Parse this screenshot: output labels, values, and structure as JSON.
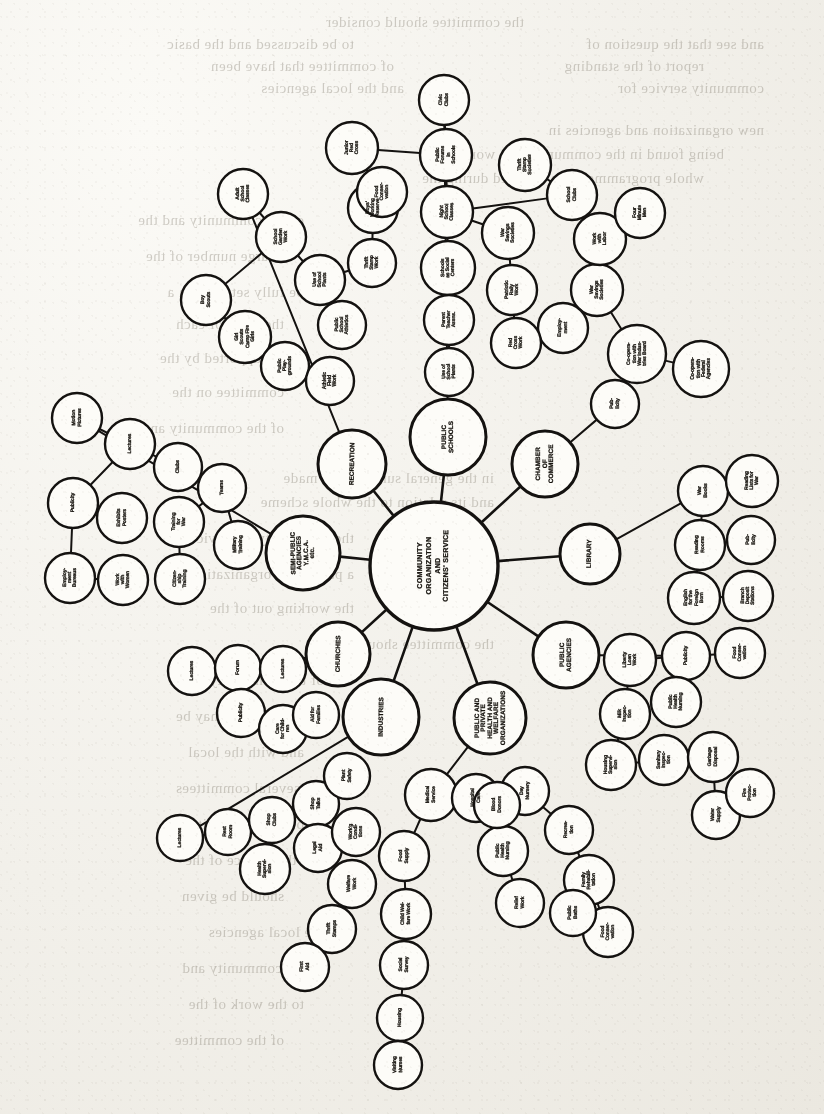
{
  "document": {
    "kind": "scanned-book-page",
    "figure_type": "radial hub-and-spoke organization chart",
    "ink_color": "#17140f",
    "paper_color": "#f2f0ea"
  },
  "chart_data": {
    "type": "diagram",
    "title": "COMMUNITY ORGANIZATION AND CITIZENS' SERVICE",
    "layout": "radial hub-and-spoke; one core node, eight primary hubs on a ring, each hub branching into chains of satellite nodes",
    "center": {
      "id": "core",
      "label": "COMMUNITY\nORGANIZATION\nAND\nCITIZENS' SERVICE",
      "cx": 434,
      "cy": 566,
      "r": 64
    },
    "hubs": [
      {
        "id": "public-schools",
        "label": "PUBLIC\nSCHOOLS",
        "cx": 448,
        "cy": 437,
        "r": 38,
        "angle": -84
      },
      {
        "id": "chamber",
        "label": "CHAMBER\nOF\nCOMMERCE",
        "cx": 545,
        "cy": 464,
        "r": 33,
        "angle": -45
      },
      {
        "id": "library",
        "label": "LIBRARY",
        "cx": 590,
        "cy": 554,
        "r": 30,
        "angle": -6
      },
      {
        "id": "public-agencies",
        "label": "PUBLIC\nAGENCIES",
        "cx": 566,
        "cy": 655,
        "r": 33,
        "angle": 36
      },
      {
        "id": "health-welfare",
        "label": "PUBLIC AND\nPRIVATE\nHEALTH AND\nWELFARE\nORGANIZATIONS",
        "cx": 490,
        "cy": 718,
        "r": 36,
        "angle": 72
      },
      {
        "id": "industries",
        "label": "INDUSTRIES",
        "cx": 381,
        "cy": 717,
        "r": 38,
        "angle": 115
      },
      {
        "id": "churches",
        "label": "CHURCHES",
        "cx": 338,
        "cy": 654,
        "r": 32,
        "angle": 155
      },
      {
        "id": "semi-public",
        "label": "SEMI-PUBLIC\nAGENCIES\nY.M.C.A.\netc.",
        "cx": 303,
        "cy": 553,
        "r": 37,
        "angle": 186
      },
      {
        "id": "recreation",
        "label": "RECREATION",
        "cx": 352,
        "cy": 464,
        "r": 34,
        "angle": 222
      }
    ],
    "satellites": [
      {
        "label": "Civic\nClubs",
        "cx": 444,
        "cy": 100,
        "r": 25,
        "parent": "public-schools"
      },
      {
        "label": "Public\nForums\nin\nSchools",
        "cx": 446,
        "cy": 155,
        "r": 26,
        "parent": "public-schools"
      },
      {
        "label": "Night\nSchool\nClasses",
        "cx": 447,
        "cy": 212,
        "r": 26,
        "parent": "public-schools"
      },
      {
        "label": "Schools\nas Social\nCenters",
        "cx": 448,
        "cy": 268,
        "r": 27,
        "parent": "public-schools"
      },
      {
        "label": "Parent\nTeacher\nAssns.",
        "cx": 449,
        "cy": 320,
        "r": 25,
        "parent": "public-schools"
      },
      {
        "label": "Use of\nSchool\nPlants",
        "cx": 449,
        "cy": 372,
        "r": 24,
        "parent": "public-schools"
      },
      {
        "label": "Adult\nSchool\nClasses",
        "cx": 243,
        "cy": 194,
        "r": 25,
        "parent": "recreation"
      },
      {
        "label": "School\nGarden\nWork",
        "cx": 281,
        "cy": 237,
        "r": 25,
        "parent": "recreation"
      },
      {
        "label": "Use of\nSchool\nPlants",
        "cx": 320,
        "cy": 280,
        "r": 25,
        "parent": "recreation"
      },
      {
        "label": "Public\nSchool\nAthletics",
        "cx": 342,
        "cy": 325,
        "r": 24,
        "parent": "recreation"
      },
      {
        "label": "Boy\nScouts",
        "cx": 206,
        "cy": 300,
        "r": 25,
        "parent": "recreation"
      },
      {
        "label": "Girl\nScouts\nCamp Fire\nGirls",
        "cx": 245,
        "cy": 337,
        "r": 26,
        "parent": "recreation"
      },
      {
        "label": "Public\nPlay-\ngrounds",
        "cx": 285,
        "cy": 366,
        "r": 24,
        "parent": "recreation"
      },
      {
        "label": "Athletic\nField\nWork",
        "cx": 330,
        "cy": 381,
        "r": 24,
        "parent": "recreation"
      },
      {
        "label": "Thrift\nStamp\nWork",
        "cx": 372,
        "cy": 263,
        "r": 24,
        "parent": "recreation"
      },
      {
        "label": "Boys'\nWorking\nReserve",
        "cx": 373,
        "cy": 208,
        "r": 25,
        "parent": "recreation"
      },
      {
        "label": "Motion\nPictures",
        "cx": 77,
        "cy": 418,
        "r": 25,
        "parent": "semi-public"
      },
      {
        "label": "Lectures",
        "cx": 130,
        "cy": 444,
        "r": 25,
        "parent": "semi-public"
      },
      {
        "label": "Clubs",
        "cx": 178,
        "cy": 467,
        "r": 24,
        "parent": "semi-public"
      },
      {
        "label": "Teams",
        "cx": 222,
        "cy": 488,
        "r": 24,
        "parent": "semi-public"
      },
      {
        "label": "Publicity",
        "cx": 73,
        "cy": 503,
        "r": 25,
        "parent": "semi-public"
      },
      {
        "label": "Exhibits\nPosters",
        "cx": 122,
        "cy": 518,
        "r": 25,
        "parent": "semi-public"
      },
      {
        "label": "Training\nfor\nWar",
        "cx": 179,
        "cy": 522,
        "r": 25,
        "parent": "semi-public"
      },
      {
        "label": "Employ-\nment\nBureaus",
        "cx": 70,
        "cy": 578,
        "r": 25,
        "parent": "semi-public"
      },
      {
        "label": "Work\nwith\nWomen",
        "cx": 123,
        "cy": 580,
        "r": 25,
        "parent": "semi-public"
      },
      {
        "label": "Citizen-\nship\nTraining",
        "cx": 180,
        "cy": 579,
        "r": 25,
        "parent": "semi-public"
      },
      {
        "label": "Military\nTraining",
        "cx": 238,
        "cy": 545,
        "r": 24,
        "parent": "semi-public"
      },
      {
        "label": "Lectures",
        "cx": 192,
        "cy": 671,
        "r": 24,
        "parent": "churches"
      },
      {
        "label": "Forum",
        "cx": 238,
        "cy": 668,
        "r": 23,
        "parent": "churches"
      },
      {
        "label": "Lectures",
        "cx": 283,
        "cy": 669,
        "r": 23,
        "parent": "churches"
      },
      {
        "label": "Publicity",
        "cx": 241,
        "cy": 713,
        "r": 24,
        "parent": "churches"
      },
      {
        "label": "Care\nfor Child-\nren",
        "cx": 283,
        "cy": 729,
        "r": 24,
        "parent": "churches"
      },
      {
        "label": "Aid for\nFamilies",
        "cx": 316,
        "cy": 715,
        "r": 23,
        "parent": "churches"
      },
      {
        "label": "Lectures",
        "cx": 180,
        "cy": 838,
        "r": 23,
        "parent": "industries"
      },
      {
        "label": "Rest\nRoom",
        "cx": 228,
        "cy": 832,
        "r": 23,
        "parent": "industries"
      },
      {
        "label": "Shop\nClubs",
        "cx": 272,
        "cy": 820,
        "r": 23,
        "parent": "industries"
      },
      {
        "label": "Shop\nTalks",
        "cx": 316,
        "cy": 804,
        "r": 23,
        "parent": "industries"
      },
      {
        "label": "Plant\nSafety",
        "cx": 347,
        "cy": 776,
        "r": 23,
        "parent": "industries"
      },
      {
        "label": "Legal\nAid",
        "cx": 318,
        "cy": 848,
        "r": 24,
        "parent": "industries"
      },
      {
        "label": "Health\nSupervi-\nsion",
        "cx": 265,
        "cy": 869,
        "r": 25,
        "parent": "industries"
      },
      {
        "label": "Work'g\nCondi-\ntions",
        "cx": 356,
        "cy": 832,
        "r": 24,
        "parent": "industries"
      },
      {
        "label": "Welfare\nWork",
        "cx": 352,
        "cy": 884,
        "r": 24,
        "parent": "industries"
      },
      {
        "label": "Thrift\nStamps",
        "cx": 332,
        "cy": 929,
        "r": 24,
        "parent": "industries"
      },
      {
        "label": "First\nAid",
        "cx": 305,
        "cy": 967,
        "r": 24,
        "parent": "industries"
      },
      {
        "label": "Medical\nService",
        "cx": 431,
        "cy": 795,
        "r": 26,
        "parent": "health-welfare"
      },
      {
        "label": "Food\nSupply",
        "cx": 404,
        "cy": 856,
        "r": 25,
        "parent": "health-welfare"
      },
      {
        "label": "Child Wel-\nfare Work",
        "cx": 406,
        "cy": 914,
        "r": 25,
        "parent": "health-welfare"
      },
      {
        "label": "Social\nSurvey",
        "cx": 404,
        "cy": 965,
        "r": 24,
        "parent": "health-welfare"
      },
      {
        "label": "Housing",
        "cx": 400,
        "cy": 1018,
        "r": 23,
        "parent": "health-welfare"
      },
      {
        "label": "Visiting\nNurses",
        "cx": 398,
        "cy": 1065,
        "r": 24,
        "parent": "health-welfare"
      },
      {
        "label": "Hospital\nCare",
        "cx": 476,
        "cy": 798,
        "r": 24,
        "parent": "health-welfare"
      },
      {
        "label": "Public\nHealth\nNursing",
        "cx": 503,
        "cy": 851,
        "r": 25,
        "parent": "health-welfare"
      },
      {
        "label": "Relief\nWork",
        "cx": 520,
        "cy": 903,
        "r": 24,
        "parent": "health-welfare"
      },
      {
        "label": "Day\nNursery",
        "cx": 525,
        "cy": 791,
        "r": 24,
        "parent": "health-welfare"
      },
      {
        "label": "Recrea-\ntion",
        "cx": 569,
        "cy": 830,
        "r": 24,
        "parent": "health-welfare"
      },
      {
        "label": "Family\nRehabili-\ntation",
        "cx": 589,
        "cy": 880,
        "r": 25,
        "parent": "health-welfare"
      },
      {
        "label": "Food\nConser-\nvation",
        "cx": 608,
        "cy": 932,
        "r": 25,
        "parent": "health-welfare"
      },
      {
        "label": "Blood\nDonors",
        "cx": 497,
        "cy": 805,
        "r": 23,
        "parent": "health-welfare"
      },
      {
        "label": "Public\nBaths",
        "cx": 573,
        "cy": 913,
        "r": 23,
        "parent": "health-welfare"
      },
      {
        "label": "Publicity",
        "cx": 686,
        "cy": 656,
        "r": 24,
        "parent": "public-agencies"
      },
      {
        "label": "Food\nConser-\nvation",
        "cx": 740,
        "cy": 653,
        "r": 25,
        "parent": "public-agencies"
      },
      {
        "label": "Liberty\nLoan\nWork",
        "cx": 630,
        "cy": 660,
        "r": 26,
        "parent": "public-agencies"
      },
      {
        "label": "Milk\nInspec-\ntion",
        "cx": 625,
        "cy": 714,
        "r": 25,
        "parent": "public-agencies"
      },
      {
        "label": "Public\nHealth\nNursing",
        "cx": 676,
        "cy": 702,
        "r": 25,
        "parent": "public-agencies"
      },
      {
        "label": "Housing\nSupervi-\nsion",
        "cx": 611,
        "cy": 765,
        "r": 25,
        "parent": "public-agencies"
      },
      {
        "label": "Sanitary\nInspec-\ntion",
        "cx": 664,
        "cy": 760,
        "r": 25,
        "parent": "public-agencies"
      },
      {
        "label": "Garbage\nDisposal",
        "cx": 713,
        "cy": 757,
        "r": 25,
        "parent": "public-agencies"
      },
      {
        "label": "Water\nSupply",
        "cx": 716,
        "cy": 815,
        "r": 24,
        "parent": "public-agencies"
      },
      {
        "label": "Fire\nProtec-\ntion",
        "cx": 750,
        "cy": 793,
        "r": 24,
        "parent": "public-agencies"
      },
      {
        "label": "War\nBooks",
        "cx": 703,
        "cy": 491,
        "r": 25,
        "parent": "library"
      },
      {
        "label": "Reading\nLists for\nWar",
        "cx": 752,
        "cy": 481,
        "r": 26,
        "parent": "library"
      },
      {
        "label": "Reading\nRooms",
        "cx": 700,
        "cy": 545,
        "r": 25,
        "parent": "library"
      },
      {
        "label": "Pub-\nlicity",
        "cx": 751,
        "cy": 540,
        "r": 24,
        "parent": "library"
      },
      {
        "label": "English\nfor the\nForeign\nBorn",
        "cx": 694,
        "cy": 598,
        "r": 26,
        "parent": "library"
      },
      {
        "label": "Branch\nDeposit\nStations",
        "cx": 748,
        "cy": 596,
        "r": 25,
        "parent": "library"
      },
      {
        "label": "Pub-\nlicity",
        "cx": 615,
        "cy": 404,
        "r": 24,
        "parent": "chamber"
      },
      {
        "label": "Co-opera-\ntion with\nWar Indus-\ntries Board",
        "cx": 637,
        "cy": 354,
        "r": 29,
        "parent": "chamber"
      },
      {
        "label": "Co-opera-\ntion with\nFederal\nAgencies",
        "cx": 701,
        "cy": 369,
        "r": 28,
        "parent": "chamber"
      },
      {
        "label": "War\nSavings\nSocieties",
        "cx": 597,
        "cy": 290,
        "r": 26,
        "parent": "chamber"
      },
      {
        "label": "Work\nwith\nLabor",
        "cx": 600,
        "cy": 239,
        "r": 26,
        "parent": "chamber"
      },
      {
        "label": "Employ-\nment",
        "cx": 563,
        "cy": 328,
        "r": 25,
        "parent": "chamber"
      },
      {
        "label": "Four\nMinute\nMen",
        "cx": 640,
        "cy": 213,
        "r": 25,
        "parent": "chamber"
      },
      {
        "label": "School\nClubs",
        "cx": 572,
        "cy": 195,
        "r": 25,
        "parent": "public-schools"
      },
      {
        "label": "Thrift\nStamp\nSocieties",
        "cx": 525,
        "cy": 165,
        "r": 26,
        "parent": "public-schools"
      },
      {
        "label": "War\nSavings\nSocieties",
        "cx": 508,
        "cy": 233,
        "r": 26,
        "parent": "public-schools"
      },
      {
        "label": "Patriotic\nRally\nWork",
        "cx": 512,
        "cy": 290,
        "r": 25,
        "parent": "public-schools"
      },
      {
        "label": "Red\nCross\nWork",
        "cx": 516,
        "cy": 343,
        "r": 25,
        "parent": "public-schools"
      },
      {
        "label": "Junior\nRed\nCross",
        "cx": 352,
        "cy": 148,
        "r": 26,
        "parent": "public-schools"
      },
      {
        "label": "Food\nConser-\nvation",
        "cx": 382,
        "cy": 192,
        "r": 25,
        "parent": "public-schools"
      }
    ],
    "edges": [
      [
        "core",
        "public-schools"
      ],
      [
        "core",
        "chamber"
      ],
      [
        "core",
        "library"
      ],
      [
        "core",
        "public-agencies"
      ],
      [
        "core",
        "health-welfare"
      ],
      [
        "core",
        "industries"
      ],
      [
        "core",
        "churches"
      ],
      [
        "core",
        "semi-public"
      ],
      [
        "core",
        "recreation"
      ]
    ]
  },
  "bleed_through_text": [
    {
      "text": "the committee should consider",
      "x": 300,
      "y": 14
    },
    {
      "text": "and see that the question of",
      "x": 60,
      "y": 36
    },
    {
      "text": "to be discussed and the basic",
      "x": 470,
      "y": 36
    },
    {
      "text": "report of the standing",
      "x": 120,
      "y": 58
    },
    {
      "text": "of committee that have been",
      "x": 430,
      "y": 58
    },
    {
      "text": "community service for",
      "x": 60,
      "y": 80
    },
    {
      "text": "and the local agencies",
      "x": 420,
      "y": 80
    },
    {
      "text": "new organization and agencies in",
      "x": 60,
      "y": 122
    },
    {
      "text": "being found in the community; the work of the",
      "x": 100,
      "y": 146
    },
    {
      "text": "whole programme to be reported during the",
      "x": 120,
      "y": 170
    },
    {
      "text": "of the community and the",
      "x": 520,
      "y": 212
    },
    {
      "text": "a large number of the",
      "x": 540,
      "y": 248
    },
    {
      "text": "be fully set forth in a",
      "x": 520,
      "y": 284
    },
    {
      "text": "the work of each",
      "x": 540,
      "y": 316
    },
    {
      "text": "to be supported by the",
      "x": 520,
      "y": 350
    },
    {
      "text": "committee on the",
      "x": 540,
      "y": 384
    },
    {
      "text": "of the community and",
      "x": 540,
      "y": 420
    },
    {
      "text": "in the general survey to be made",
      "x": 330,
      "y": 470
    },
    {
      "text": "and its relation to the whole scheme",
      "x": 330,
      "y": 494
    },
    {
      "text": "the community of service in",
      "x": 470,
      "y": 530
    },
    {
      "text": "a part of the organization as",
      "x": 470,
      "y": 566
    },
    {
      "text": "the working out of the",
      "x": 470,
      "y": 600
    },
    {
      "text": "the committee should make",
      "x": 330,
      "y": 636
    },
    {
      "text": "of the community in the",
      "x": 500,
      "y": 672
    },
    {
      "text": "such service as may be",
      "x": 500,
      "y": 708
    },
    {
      "text": "and with the local",
      "x": 520,
      "y": 744
    },
    {
      "text": "the several committees",
      "x": 500,
      "y": 780
    },
    {
      "text": "of the community",
      "x": 520,
      "y": 816
    },
    {
      "text": "and the service of the",
      "x": 500,
      "y": 852
    },
    {
      "text": "should be given",
      "x": 540,
      "y": 888
    },
    {
      "text": "the local agencies",
      "x": 500,
      "y": 924
    },
    {
      "text": "of the community and",
      "x": 500,
      "y": 960
    },
    {
      "text": "to the work of the",
      "x": 520,
      "y": 996
    },
    {
      "text": "of the committee",
      "x": 540,
      "y": 1032
    }
  ]
}
